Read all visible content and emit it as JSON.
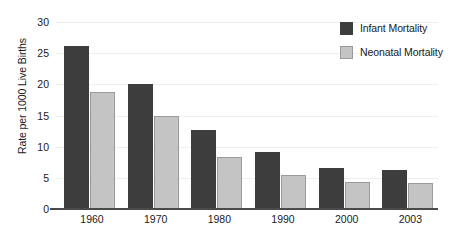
{
  "chart_data": {
    "type": "bar",
    "title": "",
    "xlabel": "",
    "ylabel": "Rate per 1000 Live Births",
    "categories": [
      "1960",
      "1970",
      "1980",
      "1990",
      "2000",
      "2003"
    ],
    "series": [
      {
        "name": "Infant Mortality",
        "color": "#3d3d3d",
        "values": [
          26.1,
          20.0,
          12.7,
          9.1,
          6.5,
          6.3
        ]
      },
      {
        "name": "Neonatal Mortality",
        "color": "#c4c4c4",
        "values": [
          18.7,
          15.0,
          8.4,
          5.5,
          4.3,
          4.2
        ]
      }
    ],
    "ylim": [
      0,
      30
    ],
    "yticks": [
      0,
      5,
      10,
      15,
      20,
      25,
      30
    ],
    "ytick_labels": [
      "0",
      "5",
      "10",
      "15",
      "20",
      "25",
      "30"
    ],
    "grid": true,
    "legend_position": "top-right"
  },
  "legend": {
    "entries": [
      {
        "label": "Infant Mortality"
      },
      {
        "label": "Neonatal Mortality"
      }
    ]
  },
  "axis": {
    "y_title": "Rate per 1000 Live Births"
  }
}
